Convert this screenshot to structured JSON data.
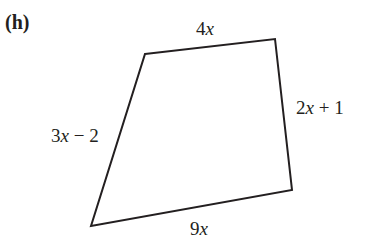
{
  "part_label": "(h)",
  "shape": {
    "type": "quadrilateral",
    "stroke_color": "#231f20",
    "vertices": [
      [
        145,
        54
      ],
      [
        275,
        39
      ],
      [
        292,
        190
      ],
      [
        91,
        226
      ]
    ]
  },
  "sides": {
    "top": {
      "coef": "4",
      "var": "x",
      "rest": ""
    },
    "right": {
      "coef": "2",
      "var": "x",
      "rest": " + 1"
    },
    "left": {
      "coef": "3",
      "var": "x",
      "rest": " − 2"
    },
    "bottom": {
      "coef": "9",
      "var": "x",
      "rest": ""
    }
  }
}
